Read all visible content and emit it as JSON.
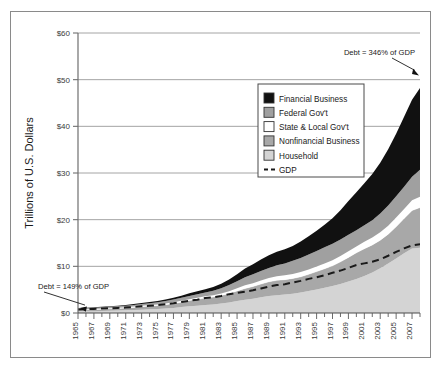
{
  "chart_data": {
    "type": "area",
    "title": "",
    "subtitle": "",
    "xlabel": "",
    "ylabel": "Trillions of U.S. Dollars",
    "ylim": [
      0,
      60
    ],
    "xlim": [
      1965,
      2008
    ],
    "grid": "horizontal",
    "legend_position": "upper-center-right",
    "stacked": true,
    "ytick_labels": [
      "$0",
      "$10",
      "$20",
      "$30",
      "$40",
      "$50",
      "$60"
    ],
    "ytick_values": [
      0,
      10,
      20,
      30,
      40,
      50,
      60
    ],
    "xtick_labels": [
      "1965",
      "1967",
      "1969",
      "1971",
      "1973",
      "1975",
      "1977",
      "1979",
      "1981",
      "1983",
      "1985",
      "1987",
      "1989",
      "1991",
      "1993",
      "1995",
      "1997",
      "1999",
      "2001",
      "2003",
      "2005",
      "2007"
    ],
    "x": [
      1965,
      1966,
      1967,
      1968,
      1969,
      1970,
      1971,
      1972,
      1973,
      1974,
      1975,
      1976,
      1977,
      1978,
      1979,
      1980,
      1981,
      1982,
      1983,
      1984,
      1985,
      1986,
      1987,
      1988,
      1989,
      1990,
      1991,
      1992,
      1993,
      1994,
      1995,
      1996,
      1997,
      1998,
      1999,
      2000,
      2001,
      2002,
      2003,
      2004,
      2005,
      2006,
      2007,
      2008
    ],
    "series": [
      {
        "name": "Household",
        "color": "#d4d4d4",
        "order": 1,
        "values": [
          0.35,
          0.38,
          0.4,
          0.44,
          0.48,
          0.51,
          0.57,
          0.64,
          0.72,
          0.78,
          0.84,
          0.95,
          1.09,
          1.26,
          1.44,
          1.58,
          1.72,
          1.82,
          2.01,
          2.25,
          2.55,
          2.83,
          3.08,
          3.35,
          3.62,
          3.81,
          3.95,
          4.15,
          4.39,
          4.72,
          5.05,
          5.42,
          5.77,
          6.21,
          6.73,
          7.28,
          7.93,
          8.7,
          9.6,
          10.6,
          11.7,
          12.8,
          13.8,
          14.0
        ]
      },
      {
        "name": "Nonfinancial Business",
        "color": "#a8a8a8",
        "order": 2,
        "values": [
          0.29,
          0.32,
          0.35,
          0.38,
          0.42,
          0.46,
          0.5,
          0.56,
          0.64,
          0.72,
          0.76,
          0.83,
          0.93,
          1.07,
          1.22,
          1.36,
          1.5,
          1.6,
          1.72,
          1.95,
          2.18,
          2.42,
          2.6,
          2.85,
          3.06,
          3.19,
          3.2,
          3.25,
          3.36,
          3.56,
          3.82,
          4.06,
          4.35,
          4.75,
          5.18,
          5.62,
          5.85,
          5.88,
          5.99,
          6.3,
          6.8,
          7.45,
          8.15,
          8.6
        ]
      },
      {
        "name": "State & Local Gov't",
        "color": "#ffffff",
        "order": 3,
        "values": [
          0.1,
          0.11,
          0.12,
          0.13,
          0.14,
          0.15,
          0.17,
          0.18,
          0.19,
          0.21,
          0.23,
          0.25,
          0.27,
          0.29,
          0.31,
          0.33,
          0.35,
          0.38,
          0.43,
          0.47,
          0.57,
          0.67,
          0.72,
          0.77,
          0.81,
          0.86,
          0.92,
          0.98,
          1.03,
          1.06,
          1.1,
          1.15,
          1.19,
          1.24,
          1.31,
          1.37,
          1.48,
          1.6,
          1.71,
          1.81,
          1.95,
          2.05,
          2.19,
          2.3
        ]
      },
      {
        "name": "Federal Gov't",
        "color": "#a0a0a0",
        "order": 4,
        "values": [
          0.26,
          0.26,
          0.27,
          0.29,
          0.29,
          0.3,
          0.33,
          0.35,
          0.36,
          0.37,
          0.45,
          0.52,
          0.58,
          0.64,
          0.69,
          0.74,
          0.82,
          0.95,
          1.14,
          1.31,
          1.51,
          1.73,
          1.89,
          2.03,
          2.14,
          2.35,
          2.56,
          2.8,
          3.03,
          3.19,
          3.31,
          3.45,
          3.52,
          3.54,
          3.57,
          3.48,
          3.52,
          3.72,
          4.0,
          4.3,
          4.55,
          4.77,
          5.05,
          5.8
        ]
      },
      {
        "name": "Financial Business",
        "color": "#111111",
        "order": 5,
        "values": [
          0.05,
          0.06,
          0.07,
          0.08,
          0.1,
          0.12,
          0.15,
          0.18,
          0.22,
          0.26,
          0.28,
          0.32,
          0.38,
          0.46,
          0.55,
          0.63,
          0.72,
          0.82,
          0.98,
          1.22,
          1.52,
          1.86,
          2.17,
          2.45,
          2.73,
          2.93,
          3.04,
          3.18,
          3.5,
          3.91,
          4.35,
          4.85,
          5.45,
          6.3,
          7.2,
          8.1,
          9.0,
          9.9,
          10.9,
          12.1,
          13.4,
          15.0,
          16.5,
          17.5
        ]
      }
    ],
    "reference_line": {
      "name": "GDP",
      "style": "dashed",
      "color": "#1a1a1a",
      "values": [
        0.74,
        0.82,
        0.87,
        0.95,
        1.02,
        1.08,
        1.17,
        1.28,
        1.43,
        1.55,
        1.69,
        1.88,
        2.09,
        2.36,
        2.63,
        2.86,
        3.21,
        3.35,
        3.64,
        4.04,
        4.34,
        4.58,
        4.87,
        5.25,
        5.66,
        5.98,
        6.17,
        6.54,
        6.88,
        7.31,
        7.66,
        8.1,
        8.61,
        9.09,
        9.66,
        10.29,
        10.63,
        11.0,
        11.51,
        12.27,
        13.09,
        13.86,
        14.48,
        14.72
      ]
    },
    "annotations": [
      {
        "name": "start-annotation",
        "text": "Debt = 149% of GDP",
        "target_x": 1965,
        "target_y": 1.05
      },
      {
        "name": "end-annotation",
        "text": "Debt = 346% of GDP",
        "target_x": 2008,
        "target_y": 50.9
      }
    ],
    "legend_entries": [
      {
        "label": "Financial Business",
        "swatch": "#111111",
        "type": "area"
      },
      {
        "label": "Federal Gov't",
        "swatch": "#a0a0a0",
        "type": "area"
      },
      {
        "label": "State & Local Gov't",
        "swatch": "#ffffff",
        "type": "area"
      },
      {
        "label": "Nonfinancial Business",
        "swatch": "#a8a8a8",
        "type": "area"
      },
      {
        "label": "Household",
        "swatch": "#d4d4d4",
        "type": "area"
      },
      {
        "label": "GDP",
        "swatch": "#1a1a1a",
        "type": "dashed-line"
      }
    ]
  },
  "axis": {
    "y_title": "Trillions of U.S. Dollars"
  }
}
